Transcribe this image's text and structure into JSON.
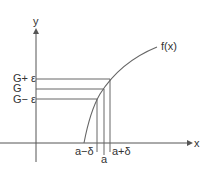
{
  "diagram": {
    "axes": {
      "x_label": "x",
      "y_label": "y"
    },
    "curve_label": "f(x)",
    "y_ticks": [
      {
        "label": "G+ ε",
        "y": 79
      },
      {
        "label": "G",
        "y": 89
      },
      {
        "label": "G− ε",
        "y": 99
      }
    ],
    "x_ticks": [
      {
        "label": "a−δ",
        "x": 97
      },
      {
        "label": "a",
        "x": 104
      },
      {
        "label": "a+δ",
        "x": 110
      }
    ],
    "colors": {
      "lines": "#666666",
      "text": "#333333",
      "background": "#ffffff"
    }
  }
}
